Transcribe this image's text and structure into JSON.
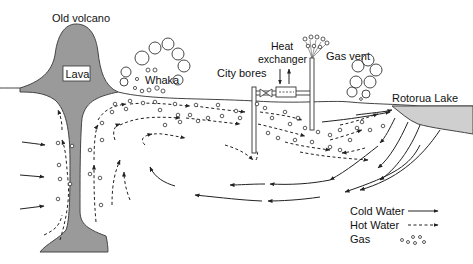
{
  "diagram": {
    "labels": {
      "old_volcano": "Old volcano",
      "lava": "Lava",
      "whaka": "Whaka",
      "city_bores": "City bores",
      "heat_exchanger_line1": "Heat",
      "heat_exchanger_line2": "exchanger",
      "gas_vent": "Gas vent",
      "rotorua_lake": "Rotorua Lake"
    },
    "legend": {
      "items": [
        {
          "label": "Cold Water",
          "symbol": "solid-arrow"
        },
        {
          "label": "Hot Water",
          "symbol": "dashed-arrow"
        },
        {
          "label": "Gas",
          "symbol": "bubbles"
        }
      ]
    },
    "colors": {
      "lava_fill": "#9a9a9a",
      "lake_fill": "#cfcfcf",
      "line": "#222222",
      "background": "#ffffff"
    }
  }
}
